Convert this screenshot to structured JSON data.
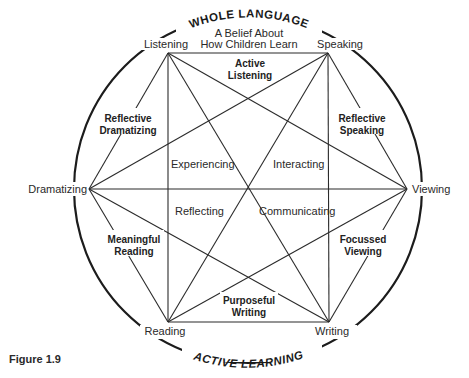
{
  "diagram": {
    "top_arc_title": "WHOLE LANGUAGE",
    "subtitle_line1": "A Belief About",
    "subtitle_line2": "How Children Learn",
    "bottom_arc_title": "ACTIVE LEARNING",
    "caption": "Figure 1.9",
    "vertices": {
      "listening": "Listening",
      "speaking": "Speaking",
      "viewing": "Viewing",
      "writing": "Writing",
      "reading": "Reading",
      "dramatizing": "Dramatizing"
    },
    "edge_labels": {
      "active_listening": [
        "Active",
        "Listening"
      ],
      "reflective_speaking": [
        "Reflective",
        "Speaking"
      ],
      "focussed_viewing": [
        "Focussed",
        "Viewing"
      ],
      "purposeful_writing": [
        "Purposeful",
        "Writing"
      ],
      "meaningful_reading": [
        "Meaningful",
        "Reading"
      ],
      "reflective_dramatizing": [
        "Reflective",
        "Dramatizing"
      ]
    },
    "inner_labels": {
      "experiencing": "Experiencing",
      "interacting": "Interacting",
      "reflecting": "Reflecting",
      "communicating": "Communicating"
    },
    "colors": {
      "ink": "#2b2b2b",
      "background": "#ffffff"
    }
  }
}
